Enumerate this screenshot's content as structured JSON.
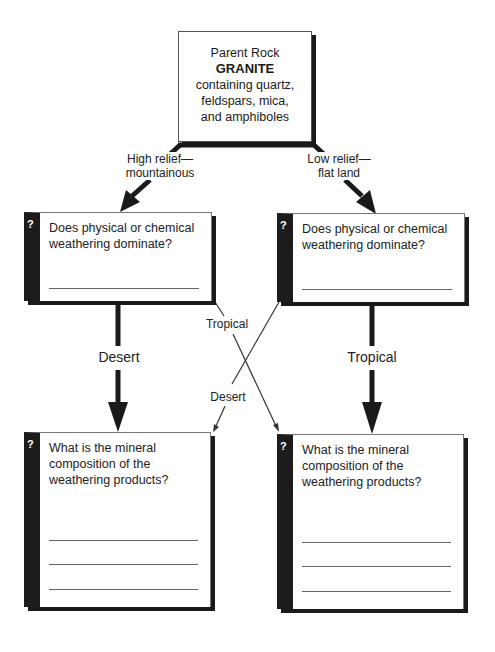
{
  "parent_rock": {
    "heading": "Parent Rock",
    "name": "GRANITE",
    "description_lines": [
      "containing quartz,",
      "feldspars, mica,",
      "and amphiboles"
    ]
  },
  "branches": {
    "left": {
      "label_line1": "High relief—",
      "label_line2": "mountainous"
    },
    "right": {
      "label_line1": "Low relief—",
      "label_line2": "flat land"
    }
  },
  "question_boxes": {
    "top_left": {
      "icon": "?",
      "question": "Does physical or chemical weathering dominate?",
      "answer_lines": 1
    },
    "top_right": {
      "icon": "?",
      "question": "Does physical or chemical weathering dominate?",
      "answer_lines": 1
    },
    "bottom_left": {
      "icon": "?",
      "question": "What is the mineral composition of the weathering products?",
      "answer_lines": 3
    },
    "bottom_right": {
      "icon": "?",
      "question": "What is the mineral composition of the weathering products?",
      "answer_lines": 3
    }
  },
  "climate_arrows": {
    "left_down": "Desert",
    "right_down": "Tropical",
    "cross_left_to_right": "Tropical",
    "cross_right_to_left": "Desert"
  },
  "colors": {
    "ink": "#1a1a1a",
    "line": "#666666",
    "background": "#ffffff"
  }
}
